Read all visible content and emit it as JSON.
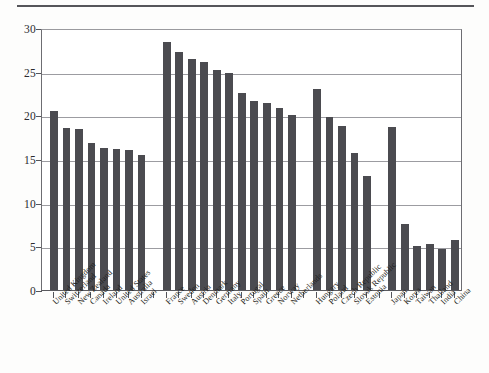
{
  "page": {
    "top_rule": "horizontal-rule"
  },
  "chart_data": {
    "type": "bar",
    "title": "",
    "subtitle": "",
    "xlabel": "",
    "ylabel": "",
    "ylim": [
      0,
      30
    ],
    "yticks": [
      0,
      5,
      10,
      15,
      20,
      25,
      30
    ],
    "ytick_labels": [
      "0",
      "5",
      "10",
      "15",
      "20",
      "25",
      "30"
    ],
    "grid": true,
    "legend": "none",
    "bar_color": "#4b4b50",
    "axis_color": "#55555a",
    "grid_color": "#9c9ca1",
    "categories": [
      "United Kingdom",
      "Switzerland",
      "New Zealand",
      "Canada",
      "Ireland",
      "United States",
      "Australia",
      "Israel",
      "France",
      "Sweden",
      "Austria",
      "Denmark",
      "Germany",
      "Italy",
      "Portugal",
      "Spain",
      "Greece",
      "Norway",
      "Netherlands",
      "Hungary",
      "Poland",
      "Czech Republic",
      "Slovak Republic",
      "Estonia",
      "Japan",
      "Korea",
      "Taiwan",
      "Thailand",
      "India",
      "China"
    ],
    "values": [
      20.5,
      18.6,
      18.4,
      16.8,
      16.3,
      16.2,
      16.0,
      15.5,
      28.4,
      27.3,
      26.4,
      26.1,
      25.2,
      24.9,
      22.6,
      21.6,
      21.4,
      20.8,
      20.0,
      23.0,
      19.8,
      18.8,
      15.7,
      13.1,
      18.7,
      7.6,
      5.0,
      5.3,
      4.7,
      5.7
    ],
    "group_breaks_after": [
      7,
      18,
      23
    ],
    "groups": [
      {
        "name": "group-1",
        "start": 0,
        "end": 7
      },
      {
        "name": "group-2",
        "start": 8,
        "end": 18
      },
      {
        "name": "group-3",
        "start": 19,
        "end": 23
      },
      {
        "name": "group-4",
        "start": 24,
        "end": 29
      }
    ]
  }
}
